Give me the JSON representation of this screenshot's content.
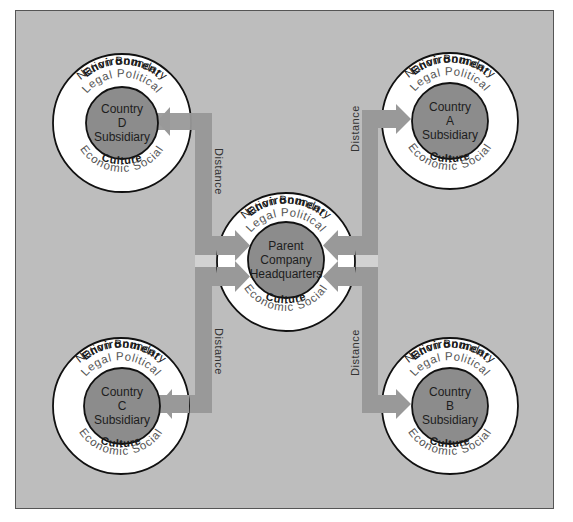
{
  "diagram": {
    "colors": {
      "frame_bg": "#bdbdbd",
      "frame_border": "#555555",
      "ring_fill": "#ffffff",
      "ring_stroke": "#111111",
      "core_fill": "#8c8c8c",
      "bar_fill": "#999999",
      "light_strip": "#d2d2d2"
    },
    "ring_labels": {
      "nation_boundary": "Nation Boundary",
      "environment": "Environment",
      "legal_political": "Legal Political",
      "economic_social": "Economic Social",
      "culture": "Culture"
    },
    "nodes": [
      {
        "id": "parent",
        "line1": "Parent",
        "line2": "Company",
        "line3": "Headquarters"
      },
      {
        "id": "country-a",
        "line1": "Country",
        "line2": "A",
        "line3": "Subsidiary"
      },
      {
        "id": "country-b",
        "line1": "Country",
        "line2": "B",
        "line3": "Subsidiary"
      },
      {
        "id": "country-c",
        "line1": "Country",
        "line2": "C",
        "line3": "Subsidiary"
      },
      {
        "id": "country-d",
        "line1": "Country",
        "line2": "D",
        "line3": "Subsidiary"
      }
    ],
    "connectors": [
      {
        "from": "parent",
        "to": "country-d",
        "label": "Distance"
      },
      {
        "from": "parent",
        "to": "country-a",
        "label": "Distance"
      },
      {
        "from": "parent",
        "to": "country-c",
        "label": "Distance"
      },
      {
        "from": "parent",
        "to": "country-b",
        "label": "Distance"
      }
    ]
  }
}
